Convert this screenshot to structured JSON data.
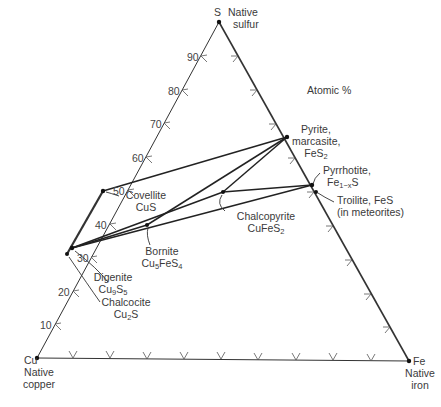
{
  "diagram": {
    "type": "ternary-phase-diagram",
    "units_label": "Atomic %",
    "vertices": {
      "S": {
        "symbol": "S",
        "name": "Native sulfur",
        "line1": "Native",
        "line2": "sulfur"
      },
      "Cu": {
        "symbol": "Cu",
        "name": "Native copper",
        "line1": "Native",
        "line2": "copper"
      },
      "Fe": {
        "symbol": "Fe",
        "name": "Native iron",
        "line1": "Native",
        "line2": "iron"
      }
    },
    "s_axis_ticks": [
      "10",
      "20",
      "30",
      "40",
      "50",
      "60",
      "70",
      "80",
      "90"
    ],
    "minerals": [
      {
        "name": "Pyrite, marcasite",
        "line1": "Pyrite,",
        "line2": "marcasite,",
        "formula": "FeS",
        "formula_sub": "2"
      },
      {
        "name": "Pyrrhotite",
        "line1": "Pyrrhotite,",
        "formula": "Fe",
        "formula_sub": "1−x",
        "formula_tail": "S"
      },
      {
        "name": "Troilite",
        "line1": "Troilite, FeS",
        "line2": "(in meteorites)"
      },
      {
        "name": "Chalcopyrite",
        "line1": "Chalcopyrite",
        "formula": "CuFeS",
        "formula_sub": "2"
      },
      {
        "name": "Covellite",
        "line1": "Covellite",
        "formula": "CuS"
      },
      {
        "name": "Bornite",
        "line1": "Bornite",
        "formula": "Cu",
        "formula_sub": "5",
        "formula_mid": "FeS",
        "formula_sub2": "4"
      },
      {
        "name": "Digenite",
        "line1": "Digenite",
        "formula": "Cu",
        "formula_sub": "9",
        "formula_mid": "S",
        "formula_sub2": "5"
      },
      {
        "name": "Chalcocite",
        "line1": "Chalcocite",
        "formula": "Cu",
        "formula_sub": "2",
        "formula_mid": "S"
      }
    ]
  }
}
